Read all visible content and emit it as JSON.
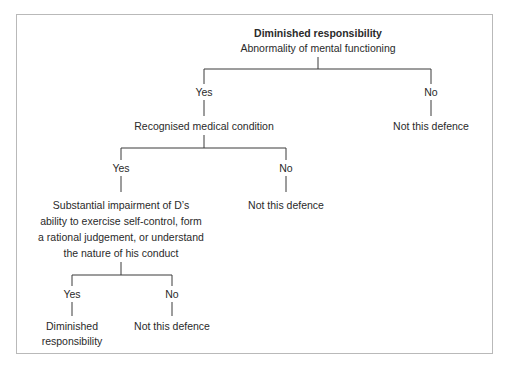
{
  "diagram": {
    "title": "Diminished responsibility",
    "root_question": "Abnormality of mental functioning",
    "level1": {
      "yes_label": "Yes",
      "no_label": "No",
      "yes_node": "Recognised medical condition",
      "no_node": "Not this defence"
    },
    "level2": {
      "yes_label": "Yes",
      "no_label": "No",
      "yes_node_lines": [
        "Substantial impairment of D’s",
        "ability to exercise self-control, form",
        "a rational judgement, or understand",
        "the nature of his conduct"
      ],
      "no_node": "Not this defence"
    },
    "level3": {
      "yes_label": "Yes",
      "no_label": "No",
      "yes_node_lines": [
        "Diminished",
        "responsibility"
      ],
      "no_node": "Not this defence"
    },
    "colors": {
      "text": "#2a2a2a",
      "lines": "#3a3a3a",
      "frame": "#b9b9b9"
    }
  }
}
